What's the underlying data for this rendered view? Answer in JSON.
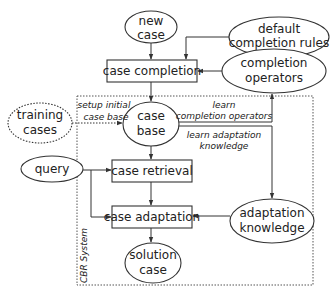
{
  "diagram": {
    "title": "CBR System",
    "nodes": {
      "new_case": [
        "new",
        "case"
      ],
      "default_rules": [
        "default",
        "completion rules"
      ],
      "case_completion": "case completion",
      "completion_operators": [
        "completion",
        "operators"
      ],
      "training_cases": [
        "training",
        "cases"
      ],
      "case_base": [
        "case",
        "base"
      ],
      "query": "query",
      "case_retrieval": "case retrieval",
      "case_adaptation": "case adaptation",
      "adaptation_knowledge": [
        "adaptation",
        "knowledge"
      ],
      "solution_case": [
        "solution",
        "case"
      ]
    },
    "edge_labels": {
      "setup": [
        "setup initial",
        "case base"
      ],
      "learn_completion": [
        "learn",
        "completion operators"
      ],
      "learn_adaptation": [
        "learn adaptation",
        "knowledge"
      ]
    },
    "system_label": "CBR System"
  },
  "colors": {
    "stroke": "#333333",
    "text": "#222222",
    "background": "#ffffff"
  }
}
